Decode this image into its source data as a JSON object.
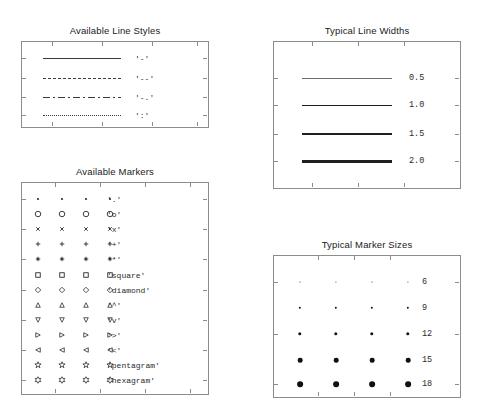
{
  "figure": {
    "background": "#ffffff",
    "axes_color": "#8c8c8c",
    "ink_color": "#2b2b2b"
  },
  "chart_data": {
    "type": "table",
    "panels": [
      {
        "id": "line-styles",
        "title": "Available Line Styles",
        "xlabel": "",
        "ylabel": "",
        "grid": false,
        "legend": "none",
        "rows": [
          {
            "style": "solid",
            "label": "'-'"
          },
          {
            "style": "dashed",
            "label": "'--'"
          },
          {
            "style": "dashdot",
            "label": "'-.'"
          },
          {
            "style": "dotted",
            "label": "':'"
          }
        ]
      },
      {
        "id": "line-widths",
        "title": "Typical Line Widths",
        "xlabel": "",
        "ylabel": "",
        "grid": false,
        "legend": "none",
        "rows": [
          {
            "width": 0.5,
            "label": "0.5"
          },
          {
            "width": 1.0,
            "label": "1.0"
          },
          {
            "width": 1.5,
            "label": "1.5"
          },
          {
            "width": 2.0,
            "label": "2.0"
          }
        ]
      },
      {
        "id": "markers",
        "title": "Available Markers",
        "xlabel": "",
        "ylabel": "",
        "grid": false,
        "legend": "none",
        "columns": 4,
        "rows": [
          {
            "marker": "point",
            "label": "'.'"
          },
          {
            "marker": "circle",
            "label": "'o'"
          },
          {
            "marker": "cross",
            "label": "'x'"
          },
          {
            "marker": "plus",
            "label": "'+'"
          },
          {
            "marker": "asterisk",
            "label": "'*'"
          },
          {
            "marker": "square",
            "label": "'square'"
          },
          {
            "marker": "diamond",
            "label": "'diamond'"
          },
          {
            "marker": "triangle-up",
            "label": "'^'"
          },
          {
            "marker": "triangle-down",
            "label": "'v'"
          },
          {
            "marker": "triangle-right",
            "label": "'>'"
          },
          {
            "marker": "triangle-left",
            "label": "'<'"
          },
          {
            "marker": "pentagram",
            "label": "'pentagram'"
          },
          {
            "marker": "hexagram",
            "label": "'hexagram'"
          }
        ]
      },
      {
        "id": "marker-sizes",
        "title": "Typical Marker Sizes",
        "xlabel": "",
        "ylabel": "",
        "grid": false,
        "legend": "none",
        "columns": 4,
        "rows": [
          {
            "size": 6,
            "label": "6"
          },
          {
            "size": 9,
            "label": "9"
          },
          {
            "size": 12,
            "label": "12"
          },
          {
            "size": 15,
            "label": "15"
          },
          {
            "size": 18,
            "label": "18"
          }
        ]
      }
    ]
  }
}
